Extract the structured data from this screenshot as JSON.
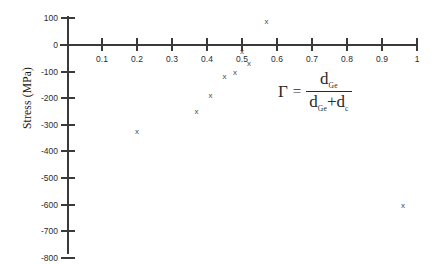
{
  "chart_data": {
    "type": "scatter",
    "title": "",
    "xlabel": "",
    "ylabel": "Stress (MPa)",
    "xlim": [
      0,
      1.05
    ],
    "ylim": [
      -800,
      100
    ],
    "grid": false,
    "legend": false,
    "x_ticks": [
      "0.1",
      "0.2",
      "0.3",
      "0.4",
      "0.5",
      "0.6",
      "0.7",
      "0.8",
      "0.9",
      "1"
    ],
    "x_tick_values": [
      0.1,
      0.2,
      0.3,
      0.4,
      0.5,
      0.6,
      0.7,
      0.8,
      0.9,
      1.0
    ],
    "y_ticks": [
      "100",
      "0",
      "-100",
      "-200",
      "-300",
      "-400",
      "-500",
      "-600",
      "-700",
      "-800"
    ],
    "y_tick_values": [
      100,
      0,
      -100,
      -200,
      -300,
      -400,
      -500,
      -600,
      -700,
      -800
    ],
    "marker_symbol": "x",
    "marker_color": "#4a4a4a",
    "axis_color": "#3a3a3a",
    "points": [
      {
        "x": 0.2,
        "y": -325
      },
      {
        "x": 0.37,
        "y": -250
      },
      {
        "x": 0.41,
        "y": -190
      },
      {
        "x": 0.45,
        "y": -120
      },
      {
        "x": 0.48,
        "y": -105
      },
      {
        "x": 0.5,
        "y": -25
      },
      {
        "x": 0.52,
        "y": -70
      },
      {
        "x": 0.57,
        "y": 90
      },
      {
        "x": 0.96,
        "y": -605
      }
    ],
    "annotation": {
      "name": "gamma-definition",
      "gamma": "Γ",
      "equals": "=",
      "numerator_base": "d",
      "numerator_sub": "Ge",
      "denominator_first_base": "d",
      "denominator_first_sub": "Ge",
      "denominator_plus": "+",
      "denominator_second_base": "d",
      "denominator_second_sub": "c"
    }
  }
}
